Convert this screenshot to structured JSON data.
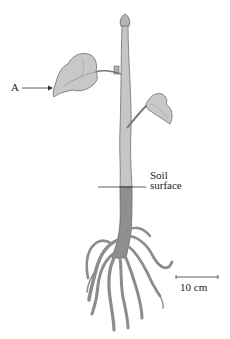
{
  "figure": {
    "labels": {
      "leaf_label": "A",
      "soil_line1": "Soil",
      "soil_line2": "surface",
      "scale_bar": "10 cm"
    },
    "colors": {
      "shoot": "#c4c4c4",
      "leaf": "#c8c8c8",
      "root": "#8f8f8f",
      "outline": "#6b6b6b",
      "text": "#222222"
    }
  }
}
